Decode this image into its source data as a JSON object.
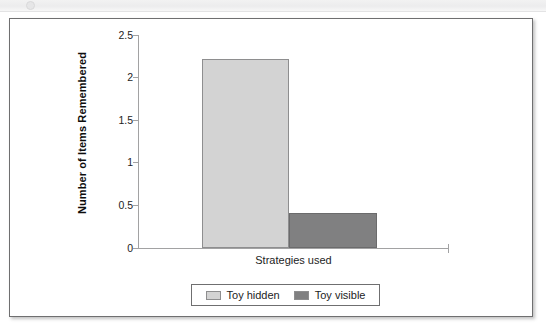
{
  "figure": {
    "panel_border_color": "#6f6f70",
    "background": "#ffffff"
  },
  "chart_data": {
    "type": "bar",
    "title": "",
    "xlabel": "Strategies used",
    "ylabel": "Number of Items Remembered",
    "categories": [
      "Strategies used"
    ],
    "ylim": [
      0,
      2.5
    ],
    "yticks": [
      0,
      0.5,
      1,
      1.5,
      2,
      2.5
    ],
    "ytick_labels": [
      "0",
      "0.5",
      "1",
      "1.5",
      "2",
      "2.5"
    ],
    "grid": false,
    "legend_position": "bottom",
    "series": [
      {
        "name": "Toy hidden",
        "values": [
          2.22
        ],
        "color": "#d3d3d3",
        "edge_color": "#8e8e8f"
      },
      {
        "name": "Toy visible",
        "values": [
          0.41
        ],
        "color": "#808081",
        "edge_color": "#6b6b6c"
      }
    ]
  },
  "legend": {
    "entries": [
      {
        "label": "Toy hidden",
        "color": "#d3d3d3"
      },
      {
        "label": "Toy visible",
        "color": "#808081"
      }
    ]
  }
}
